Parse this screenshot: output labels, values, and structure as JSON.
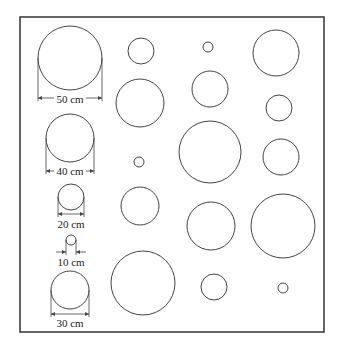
{
  "frame": {
    "x": 20,
    "y": 17,
    "w": 304,
    "h": 315,
    "stroke": "#333333"
  },
  "circle_stroke": "#444444",
  "reference_circles": [
    {
      "label": "50 cm",
      "cx": 70,
      "cy": 58,
      "r": 32,
      "dim_y": 98,
      "text_y": 103
    },
    {
      "label": "40 cm",
      "cx": 70,
      "cy": 138,
      "r": 24,
      "dim_y": 171,
      "text_y": 175
    },
    {
      "label": "20 cm",
      "cx": 71,
      "cy": 197,
      "r": 13,
      "dim_y": 214,
      "text_y": 228
    },
    {
      "label": "10 cm",
      "cx": 71,
      "cy": 240,
      "r": 5,
      "dim_y": 252,
      "text_y": 266
    },
    {
      "label": "30 cm",
      "cx": 70,
      "cy": 290,
      "r": 19,
      "dim_y": 314,
      "text_y": 327
    }
  ],
  "field_circles": [
    {
      "cx": 141,
      "cy": 51,
      "r": 13
    },
    {
      "cx": 208,
      "cy": 47,
      "r": 5
    },
    {
      "cx": 276,
      "cy": 53,
      "r": 23
    },
    {
      "cx": 140,
      "cy": 103,
      "r": 24
    },
    {
      "cx": 210,
      "cy": 89,
      "r": 18
    },
    {
      "cx": 279,
      "cy": 108,
      "r": 13
    },
    {
      "cx": 139,
      "cy": 162,
      "r": 5
    },
    {
      "cx": 210,
      "cy": 152,
      "r": 31
    },
    {
      "cx": 281,
      "cy": 157,
      "r": 18
    },
    {
      "cx": 140,
      "cy": 206,
      "r": 19
    },
    {
      "cx": 211,
      "cy": 226,
      "r": 24
    },
    {
      "cx": 283,
      "cy": 226,
      "r": 32
    },
    {
      "cx": 143,
      "cy": 283,
      "r": 32
    },
    {
      "cx": 214,
      "cy": 287,
      "r": 13
    },
    {
      "cx": 283,
      "cy": 288,
      "r": 5
    }
  ]
}
